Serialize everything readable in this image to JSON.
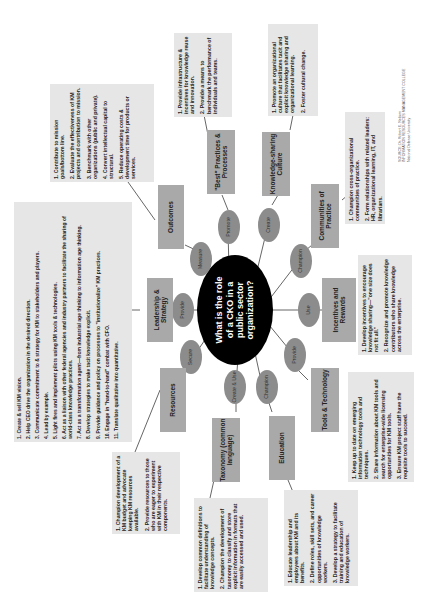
{
  "diagram": {
    "title": "What is the role of a CKO in a public sector organization?",
    "title_lines": [
      "What is the role",
      "of a CKO in a",
      "public sector",
      "organization?"
    ],
    "orientation": "rotated-90-ccw",
    "colors": {
      "hub": "#000000",
      "verb": "#8c8c8c",
      "category": "#a9a9a9",
      "note": "#e6e6e6",
      "line": "#555555"
    },
    "branches": [
      {
        "id": "outcomes",
        "verb": "Measure",
        "category": "Outcomes",
        "items": [
          "1. Contribute to mission goals/bottom line.",
          "2. Evaluate the effectiveness of KM projects and contribution to mission.",
          "3. Benchmark with other organizations (public and private).",
          "4. Convert intellectual capital to structural.",
          "5. Reduce operating costs & development time for products or services."
        ]
      },
      {
        "id": "best-practices",
        "verb": "Promote",
        "category": "\"Best\" Practices & Processes",
        "items": [
          "1. Provide infrastructure & incentives for knowledge reuse and innovation.",
          "2. Provide a means to benchmark the performance of individuals and teams."
        ]
      },
      {
        "id": "knowledge-culture",
        "verb": "Create",
        "category": "Knowledge-sharing Culture",
        "items": [
          "1. Promote an organizational culture that facilitates tacit and explicit knowledge sharing and organizational learning.",
          "2. Foster cultural change."
        ]
      },
      {
        "id": "communities",
        "verb": "Champion",
        "category": "Communities of Practice",
        "items": [
          "1. Champion cross-organizational communities of practice.",
          "2. Form relationships with related leaders: HR, organizational learning, IT, and librarians."
        ]
      },
      {
        "id": "incentives",
        "verb": "Use",
        "category": "Incentives and Rewards",
        "items": [
          "1. Develop incentives to encourage knowledge sharing—\"one size does not fit all.\"",
          "2. Recognize and promote knowledge contributors who share knowledge across the enterprise."
        ]
      },
      {
        "id": "tools",
        "verb": "Provide",
        "category": "Tools & Technology",
        "items": [
          "1. Keep up to date on emerging information technology tools and techniques.",
          "2. Share information about KM tools and search for enterprise-wide licensing opportunities for KM tools.",
          "3. Ensure KM project staff have the requisite tools to succeed."
        ]
      },
      {
        "id": "education",
        "verb": "Champion",
        "category": "Education",
        "items": [
          "1. Educate leadership and employees about KM and its benefits.",
          "2. Define roles, skill sets, and career opportunities of knowledge workers.",
          "3. Develop a strategy to facilitate training and education of knowledge workers."
        ]
      },
      {
        "id": "taxonomy",
        "verb": "Create & Use",
        "category": "Taxonomy (common language)",
        "items": [
          "1. Develop common definitions to facilitate understanding of knowledge concepts.",
          "2. Champion the development of taxonomy to classify and store explicit information in formats that are easily accessed and used."
        ]
      },
      {
        "id": "resources",
        "verb": "Secure",
        "category": "Resources",
        "items": [
          "1. Champion development of a KM budget and advocate keeping KM resources available.",
          "2. Provide resources to those who are eager to experiment with KM in their respective components."
        ]
      },
      {
        "id": "leadership",
        "verb": "Provide",
        "category": "Leadership & Strategy",
        "items": [
          "1. Create & sell KM vision.",
          "2. Help CEO drive the organization in the desired direction.",
          "3. Communicate commitment to & strategy for KM to stakeholders and players.",
          "4. Lead by example.",
          "5. Light fires and implement pilots using KM tools & technologies.",
          "6. Act as a liaison with other federal agencies and industry partners to facilitate the sharing of world-class knowledge practices.",
          "7. Act as a transformation agent—from industrial age thinking to information age thinking.",
          "8. Develop strategies to make tacit knowledge explicit.",
          "9. Provide guidance and policy on processes to \"institutionalize\" KM practices.",
          "10. Engage in \"hand-to-hand\" combat with CFO.",
          "11. Translate qualitative into quantitative."
        ]
      }
    ],
    "source": {
      "lines": [
        "SOURCE: Dr. Robert E. Neilson",
        "INFORMATION RESOURCES MANAGEMENT COLLEGE",
        "National Defense University"
      ]
    }
  }
}
